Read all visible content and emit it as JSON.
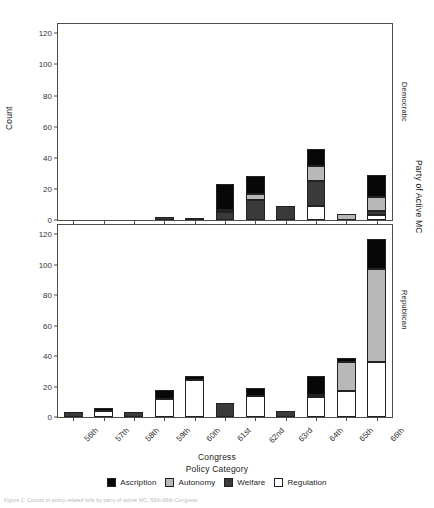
{
  "figure": {
    "ylabel": "Count",
    "xlabel": "Congress",
    "legend_title": "Policy Category",
    "right_axis_label": "Party of Active MC",
    "caption": "Figure 1: Counts of policy-related bills by party of active MC, 56th-66th Congress"
  },
  "axes": {
    "y_ticks": [
      0,
      20,
      40,
      60,
      80,
      100,
      120
    ],
    "y_min": 0,
    "y_max": 126,
    "x_ticks": [
      "56th",
      "57th",
      "58th",
      "59th",
      "60th",
      "61st",
      "62nd",
      "63rd",
      "64th",
      "65th",
      "66th"
    ]
  },
  "legend": {
    "items": [
      {
        "label": "Ascription",
        "key": "ascription",
        "color": "#070707"
      },
      {
        "label": "Autonomy",
        "key": "autonomy",
        "color": "#b8b8b8"
      },
      {
        "label": "Welfare",
        "key": "welfare",
        "color": "#3a3a3a"
      },
      {
        "label": "Regulation",
        "key": "regulation",
        "color": "#ffffff"
      }
    ]
  },
  "panels": [
    {
      "id": "dem",
      "strip_label": "Democratic"
    },
    {
      "id": "rep",
      "strip_label": "Republican"
    }
  ],
  "chart_data": {
    "type": "bar",
    "subtype": "stacked-bar-faceted",
    "title": "",
    "xlabel": "Congress",
    "ylabel": "Count",
    "legend_title": "Policy Category",
    "legend_position": "bottom",
    "grid": false,
    "ylim": [
      0,
      126
    ],
    "yticks": [
      0,
      20,
      40,
      60,
      80,
      100,
      120
    ],
    "categories": [
      "56th",
      "57th",
      "58th",
      "59th",
      "60th",
      "61st",
      "62nd",
      "63rd",
      "64th",
      "65th",
      "66th"
    ],
    "facet_variable": "Party of Active MC",
    "facets": [
      {
        "name": "Democratic",
        "series": [
          {
            "name": "Regulation",
            "color": "#ffffff",
            "values": [
              0,
              0,
              0,
              0,
              0,
              0,
              0,
              0,
              9,
              0,
              3
            ]
          },
          {
            "name": "Welfare",
            "color": "#3a3a3a",
            "values": [
              0,
              0,
              0,
              2,
              1,
              5,
              13,
              9,
              16,
              0,
              3
            ]
          },
          {
            "name": "Autonomy",
            "color": "#b8b8b8",
            "values": [
              0,
              0,
              0,
              0,
              0,
              1,
              4,
              0,
              10,
              4,
              9
            ]
          },
          {
            "name": "Ascription",
            "color": "#070707",
            "values": [
              0,
              0,
              0,
              0,
              0,
              17,
              11,
              0,
              11,
              0,
              14
            ]
          }
        ],
        "totals": [
          0,
          0,
          0,
          2,
          1,
          23,
          28,
          9,
          46,
          4,
          29
        ]
      },
      {
        "name": "Republican",
        "series": [
          {
            "name": "Regulation",
            "color": "#ffffff",
            "values": [
              0,
              4,
              0,
              12,
              24,
              0,
              14,
              0,
              13,
              17,
              36
            ]
          },
          {
            "name": "Welfare",
            "color": "#3a3a3a",
            "values": [
              3,
              0,
              3,
              0,
              0,
              9,
              0,
              4,
              0,
              0,
              0
            ]
          },
          {
            "name": "Autonomy",
            "color": "#b8b8b8",
            "values": [
              0,
              0,
              0,
              0,
              0,
              0,
              0,
              0,
              1,
              19,
              61
            ]
          },
          {
            "name": "Ascription",
            "color": "#070707",
            "values": [
              0,
              2,
              0,
              6,
              3,
              0,
              5,
              0,
              13,
              3,
              20
            ]
          }
        ],
        "totals": [
          3,
          6,
          3,
          18,
          27,
          9,
          19,
          4,
          27,
          39,
          117
        ]
      }
    ]
  }
}
